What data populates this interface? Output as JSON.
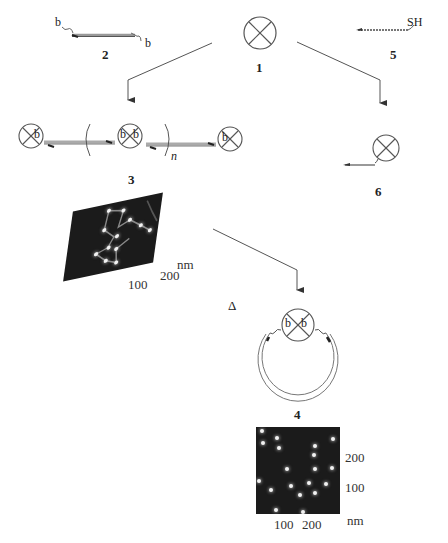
{
  "compounds": {
    "c1": {
      "number": "1",
      "symbol": "crossed-circle"
    },
    "c2": {
      "number": "2",
      "end_left": "b",
      "end_right": "b"
    },
    "c3": {
      "number": "3",
      "b_labels": [
        "b",
        "b",
        "b",
        "b"
      ],
      "repeat_subscript": "n"
    },
    "c4": {
      "number": "4",
      "b_labels": [
        "b",
        "b"
      ]
    },
    "c5": {
      "number": "5",
      "end_group": "SH"
    },
    "c6": {
      "number": "6"
    }
  },
  "conditions": {
    "heat_symbol": "Δ"
  },
  "afm_image_3": {
    "axis_unit": "nm",
    "axis_tick_1": "100",
    "axis_tick_2": "200",
    "dots": [
      [
        45,
        8
      ],
      [
        63,
        12
      ],
      [
        40,
        28
      ],
      [
        72,
        25
      ],
      [
        58,
        40
      ],
      [
        80,
        35
      ],
      [
        95,
        40
      ],
      [
        35,
        55
      ],
      [
        50,
        62
      ],
      [
        65,
        58
      ],
      [
        45,
        75
      ],
      [
        60,
        82
      ]
    ]
  },
  "afm_image_4": {
    "x_ticks": [
      "100",
      "200"
    ],
    "y_ticks": [
      "200",
      "100"
    ],
    "axis_unit": "nm",
    "dots": [
      [
        4,
        2
      ],
      [
        19,
        9
      ],
      [
        5,
        14
      ],
      [
        21,
        19
      ],
      [
        57,
        17
      ],
      [
        56,
        26
      ],
      [
        29,
        40
      ],
      [
        57,
        40
      ],
      [
        74,
        39
      ],
      [
        75,
        10
      ],
      [
        3,
        52
      ],
      [
        13,
        61
      ],
      [
        33,
        57
      ],
      [
        51,
        54
      ],
      [
        68,
        55
      ],
      [
        42,
        66
      ],
      [
        57,
        64
      ],
      [
        18,
        81
      ],
      [
        45,
        83
      ]
    ]
  }
}
